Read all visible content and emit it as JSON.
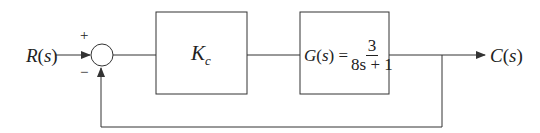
{
  "diagram": {
    "type": "feedback-control-block-diagram",
    "input": {
      "label": "R(s)",
      "func": "R",
      "arg": "s"
    },
    "output": {
      "label": "C(s)",
      "func": "C",
      "arg": "s"
    },
    "summing_junction": {
      "plus_sign": "+",
      "minus_sign": "−"
    },
    "blocks": [
      {
        "id": "controller",
        "label_main": "K",
        "label_sub": "c"
      },
      {
        "id": "plant",
        "lhs": "G(s) =",
        "lhs_func": "G",
        "lhs_arg": "s",
        "numerator": "3",
        "denominator": "8s + 1"
      }
    ],
    "feedback": {
      "type": "unity",
      "sign": "negative"
    },
    "colors": {
      "line": "#333333",
      "text": "#222222",
      "background": "#ffffff"
    }
  }
}
